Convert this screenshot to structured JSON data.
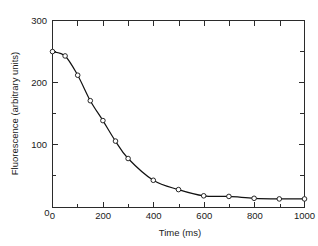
{
  "chart_data": {
    "type": "line",
    "title": "",
    "subtitle": "",
    "xlabel": "Time (ms)",
    "ylabel": "Fluorescence (arbitrary units)",
    "xlim": [
      0,
      1000
    ],
    "ylim": [
      0,
      300
    ],
    "grid": false,
    "legend": false,
    "legend_position": "none",
    "x_major_ticks": [
      0,
      200,
      400,
      600,
      800,
      1000
    ],
    "x_major_tick_labels": [
      "0",
      "200",
      "400",
      "600",
      "800",
      "1000"
    ],
    "x_minor_ticks": [
      100,
      300,
      500,
      700,
      900
    ],
    "y_major_ticks": [
      0,
      100,
      200,
      300
    ],
    "y_major_tick_labels": [
      "0",
      "100",
      "200",
      "300"
    ],
    "y_minor_ticks": [
      50,
      150,
      250
    ],
    "marker": "open-circle",
    "series": [
      {
        "name": "Fluorescence decay",
        "x": [
          0,
          50,
          100,
          150,
          200,
          250,
          300,
          400,
          500,
          600,
          700,
          800,
          900,
          1000
        ],
        "values": [
          250,
          243,
          212,
          171,
          139,
          106,
          78,
          43,
          28,
          18,
          17,
          14,
          13,
          13
        ]
      }
    ],
    "annotations": []
  },
  "figure": {
    "background_color": "#ffffff",
    "axis_color": "#2b2b2b",
    "curve_color": "#111111",
    "marker_fill_color": "#ffffff"
  }
}
